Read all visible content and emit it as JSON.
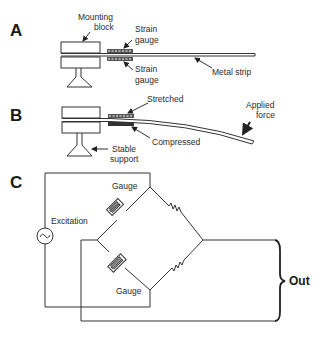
{
  "figure": {
    "panels": [
      {
        "id": "A",
        "label": "A",
        "annotations": {
          "mounting_block": [
            "Mounting",
            "block"
          ],
          "strain_gauge_top": [
            "Strain",
            "gauge"
          ],
          "strain_gauge_bottom": [
            "Strain",
            "gauge"
          ],
          "metal_strip": "Metal strip"
        }
      },
      {
        "id": "B",
        "label": "B",
        "annotations": {
          "stretched": "Stretched",
          "compressed": "Compressed",
          "applied_force": [
            "Applied",
            "force"
          ],
          "stable_support": [
            "Stable",
            "support"
          ]
        }
      },
      {
        "id": "C",
        "label": "C",
        "annotations": {
          "gauge_top": "Gauge",
          "gauge_bottom": "Gauge",
          "excitation": "Excitation",
          "out": "Out"
        }
      }
    ],
    "colors": {
      "line": "#333333",
      "background": "#ffffff"
    }
  }
}
